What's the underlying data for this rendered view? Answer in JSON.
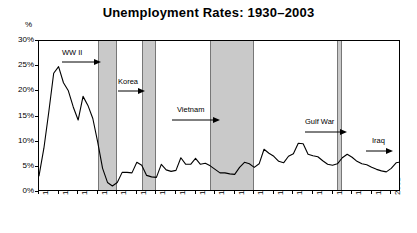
{
  "chart_data": {
    "type": "line",
    "title": "Unemployment Rates: 1930–2003",
    "xlabel": "",
    "ylabel": "%",
    "ylim": [
      0,
      30
    ],
    "xlim": [
      1929,
      2003
    ],
    "grid": false,
    "legend": "none",
    "y_ticks": [
      "0%",
      "5%",
      "10%",
      "15%",
      "20%",
      "25%",
      "30%"
    ],
    "y_tick_values": [
      0,
      5,
      10,
      15,
      20,
      25,
      30
    ],
    "x_ticks": [
      "1929",
      "1933",
      "1937",
      "1941",
      "1945",
      "1949",
      "1953",
      "1957",
      "1961",
      "1965",
      "1969",
      "1973",
      "1977",
      "1981",
      "1985",
      "1989",
      "1993",
      "1997",
      "2001"
    ],
    "x_tick_values": [
      1929,
      1933,
      1937,
      1941,
      1945,
      1949,
      1953,
      1957,
      1961,
      1965,
      1969,
      1973,
      1977,
      1981,
      1985,
      1989,
      1993,
      1997,
      2001
    ],
    "series": [
      {
        "name": "Unemployment Rate",
        "color": "#000000",
        "x": [
          1929,
          1930,
          1931,
          1932,
          1933,
          1934,
          1935,
          1936,
          1937,
          1938,
          1939,
          1940,
          1941,
          1942,
          1943,
          1944,
          1945,
          1946,
          1947,
          1948,
          1949,
          1950,
          1951,
          1952,
          1953,
          1954,
          1955,
          1956,
          1957,
          1958,
          1959,
          1960,
          1961,
          1962,
          1963,
          1964,
          1965,
          1966,
          1967,
          1968,
          1969,
          1970,
          1971,
          1972,
          1973,
          1974,
          1975,
          1976,
          1977,
          1978,
          1979,
          1980,
          1981,
          1982,
          1983,
          1984,
          1985,
          1986,
          1987,
          1988,
          1989,
          1990,
          1991,
          1992,
          1993,
          1994,
          1995,
          1996,
          1997,
          1998,
          1999,
          2000,
          2001,
          2002,
          2003
        ],
        "values": [
          3.2,
          8.7,
          15.9,
          23.6,
          24.9,
          21.7,
          20.1,
          16.9,
          14.3,
          19.0,
          17.2,
          14.6,
          9.9,
          4.7,
          1.9,
          1.2,
          1.9,
          3.9,
          3.9,
          3.8,
          5.9,
          5.3,
          3.3,
          3.0,
          2.9,
          5.5,
          4.4,
          4.1,
          4.3,
          6.8,
          5.5,
          5.5,
          6.7,
          5.5,
          5.7,
          5.2,
          4.5,
          3.8,
          3.8,
          3.6,
          3.5,
          4.9,
          5.9,
          5.6,
          4.9,
          5.6,
          8.5,
          7.7,
          7.1,
          6.1,
          5.8,
          7.1,
          7.6,
          9.7,
          9.6,
          7.5,
          7.2,
          7.0,
          6.2,
          5.5,
          5.3,
          5.6,
          6.8,
          7.5,
          6.9,
          6.1,
          5.6,
          5.4,
          4.9,
          4.5,
          4.2,
          4.0,
          4.7,
          5.8,
          6.0
        ]
      }
    ],
    "shaded_regions": [
      {
        "label": "WW II",
        "start": 1941,
        "end": 1945
      },
      {
        "label": "Korea",
        "start": 1950,
        "end": 1953
      },
      {
        "label": "Vietnam",
        "start": 1964,
        "end": 1973
      },
      {
        "label": "Gulf War",
        "start": 1990,
        "end": 1991
      },
      {
        "label": "Iraq",
        "start": 2003,
        "end": 2003
      }
    ],
    "annotations": [
      {
        "text": "WW II",
        "arrow": "right"
      },
      {
        "text": "Korea",
        "arrow": "right"
      },
      {
        "text": "Vietnam",
        "arrow": "right"
      },
      {
        "text": "Gulf War",
        "arrow": "right"
      },
      {
        "text": "Iraq",
        "arrow": "right"
      }
    ]
  }
}
